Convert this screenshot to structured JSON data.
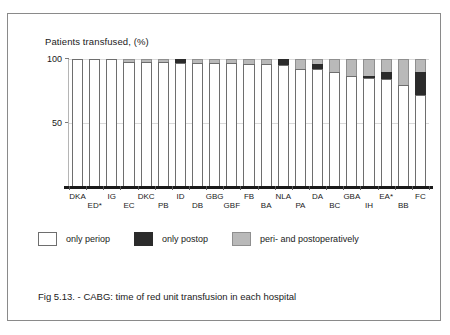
{
  "chart_data": {
    "type": "bar",
    "subtype": "stacked-column-100",
    "title": "Patients transfused, (%)",
    "xlabel": "",
    "ylabel": "Patients transfused, (%)",
    "ylim": [
      0,
      100
    ],
    "yticks": [
      50,
      100
    ],
    "ytick_labels": [
      "50",
      "100"
    ],
    "grid": true,
    "legend_position": "below-plot",
    "categories": [
      "DKA",
      "ED*",
      "IG",
      "EC",
      "DKC",
      "PB",
      "ID",
      "DB",
      "GBG",
      "GBF",
      "FB",
      "BA",
      "NLA",
      "PA",
      "DA",
      "BC",
      "GBA",
      "IH",
      "EA*",
      "BB",
      "FC"
    ],
    "series": [
      {
        "name": "only periop",
        "color": "#ffffff",
        "values": [
          100,
          100,
          100,
          98,
          98,
          98,
          97,
          97,
          97,
          96.5,
          96,
          96,
          95.5,
          92,
          92,
          90,
          87,
          85.5,
          84,
          80,
          72
        ]
      },
      {
        "name": "only postop",
        "color": "#2b2b2b",
        "values": [
          0,
          0,
          0,
          0,
          0,
          0,
          3,
          0,
          0,
          0,
          0,
          0,
          4.5,
          0,
          4,
          0,
          0,
          1.5,
          6,
          0,
          18
        ]
      },
      {
        "name": "peri- and postoperatively",
        "color": "#b9b9b9",
        "values": [
          0,
          0,
          0,
          2,
          2,
          2,
          0,
          3,
          3,
          3.5,
          4,
          4,
          0,
          8,
          4,
          10,
          13,
          13,
          10,
          20,
          10
        ]
      }
    ],
    "annotations": []
  },
  "chart": {
    "title": "Patients transfused, (%)",
    "y_axis": {
      "tick_100": "100",
      "tick_50": "50"
    }
  },
  "legend": {
    "items": [
      {
        "label": "only periop",
        "swatch": "white-square-icon"
      },
      {
        "label": "only postop",
        "swatch": "black-square-icon"
      },
      {
        "label": "peri- and postoperatively",
        "swatch": "gray-square-icon"
      }
    ]
  },
  "caption": {
    "text": "Fig 5.13. - CABG: time of red unit transfusion in each hospital"
  }
}
